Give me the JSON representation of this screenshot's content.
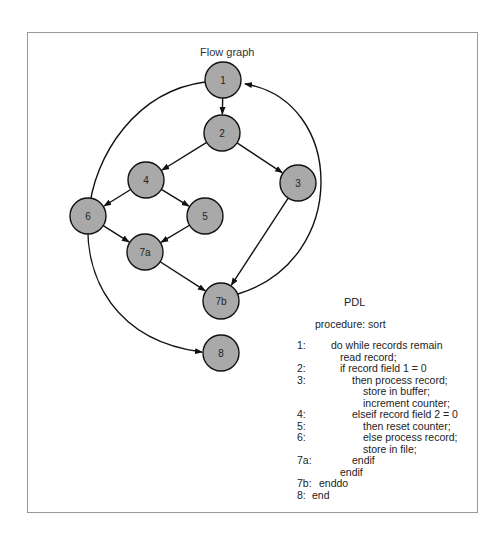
{
  "flow_graph": {
    "title": "Flow graph",
    "node_fill": "#a9a9a9",
    "nodes": [
      {
        "id": "1",
        "x": 223,
        "y": 80
      },
      {
        "id": "2",
        "x": 222,
        "y": 133
      },
      {
        "id": "3",
        "x": 298,
        "y": 183
      },
      {
        "id": "4",
        "x": 146,
        "y": 180
      },
      {
        "id": "5",
        "x": 205,
        "y": 216
      },
      {
        "id": "6",
        "x": 88,
        "y": 216
      },
      {
        "id": "7a",
        "x": 145,
        "y": 252
      },
      {
        "id": "7b",
        "x": 221,
        "y": 301
      },
      {
        "id": "8",
        "x": 221,
        "y": 353
      }
    ],
    "edges": [
      [
        "1",
        "2"
      ],
      [
        "2",
        "4"
      ],
      [
        "2",
        "3"
      ],
      [
        "4",
        "6"
      ],
      [
        "4",
        "5"
      ],
      [
        "6",
        "7a"
      ],
      [
        "5",
        "7a"
      ],
      [
        "7a",
        "7b"
      ],
      [
        "3",
        "7b"
      ],
      [
        "7b",
        "1"
      ],
      [
        "1",
        "8"
      ]
    ]
  },
  "pdl": {
    "title": "PDL",
    "procedure": "procedure: sort",
    "lines": [
      {
        "num": "1:",
        "indent": 34,
        "text": "do while records remain"
      },
      {
        "num": "",
        "indent": 43,
        "text": "read record;"
      },
      {
        "num": "2:",
        "indent": 43,
        "text": "if record field 1 = 0"
      },
      {
        "num": "3:",
        "indent": 55,
        "text": "then process record;"
      },
      {
        "num": "",
        "indent": 66,
        "text": "store in buffer;"
      },
      {
        "num": "",
        "indent": 66,
        "text": "increment counter;"
      },
      {
        "num": "4:",
        "indent": 55,
        "text": "elseif record field 2 = 0"
      },
      {
        "num": "5:",
        "indent": 66,
        "text": "then reset counter;"
      },
      {
        "num": "6:",
        "indent": 66,
        "text": "else process record;"
      },
      {
        "num": "",
        "indent": 66,
        "text": "store in file;"
      },
      {
        "num": "7a:",
        "indent": 55,
        "text": "endif"
      },
      {
        "num": "",
        "indent": 43,
        "text": "endif"
      },
      {
        "num": "7b:",
        "indent": 22,
        "text": "enddo"
      },
      {
        "num": "8:",
        "indent": 15,
        "text": "end"
      }
    ]
  }
}
